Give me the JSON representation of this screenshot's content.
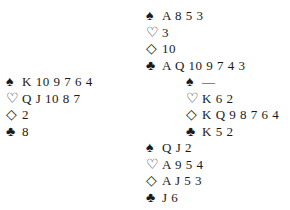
{
  "suit_symbols": {
    "spades": "♠",
    "hearts": "♡",
    "diamonds": "◇",
    "clubs": "♣"
  },
  "hands": {
    "north": {
      "spades": "A 8 5 3",
      "hearts": "3",
      "diamonds": "10",
      "clubs": "A Q 10 9 7 4 3"
    },
    "west": {
      "spades": "K 10 9 7 6 4",
      "hearts": "Q J 10 8 7",
      "diamonds": "2",
      "clubs": "8"
    },
    "east": {
      "spades": "—",
      "hearts": "K 6 2",
      "diamonds": "K Q 9 8 7 6 4",
      "clubs": "K 5 2"
    },
    "south": {
      "spades": "Q J 2",
      "hearts": "A 9 5 4",
      "diamonds": "A J 5 3",
      "clubs": "J 6"
    }
  }
}
